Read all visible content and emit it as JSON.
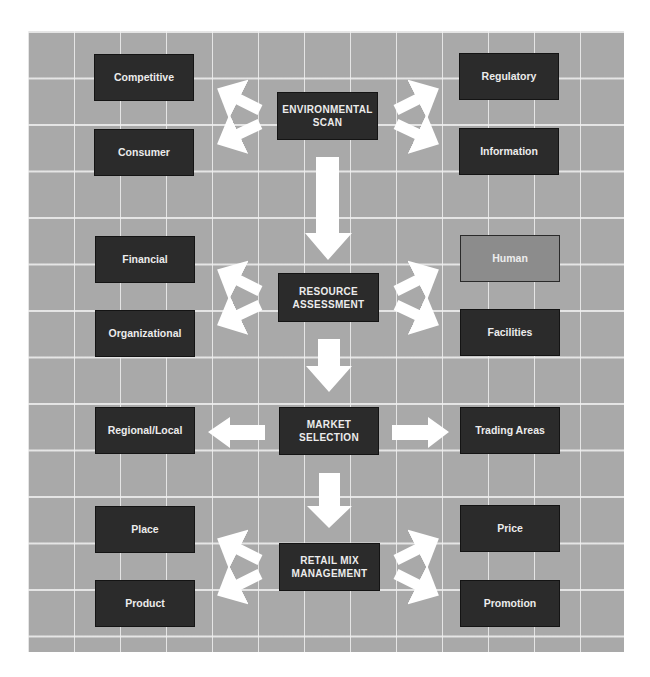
{
  "diagram": {
    "background_color": "#a9a9a9",
    "box_color": "#2b2b2b",
    "highlight_box_color": "#8c8c8c",
    "arrow_color": "#ffffff",
    "stages": [
      {
        "label": "ENVIRONMENTAL\nSCAN",
        "left": [
          "Competitive",
          "Consumer"
        ],
        "right": [
          "Regulatory",
          "Information"
        ]
      },
      {
        "label": "RESOURCE\nASSESSMENT",
        "left": [
          "Financial",
          "Organizational"
        ],
        "right": [
          "Human",
          "Facilities"
        ]
      },
      {
        "label": "MARKET\nSELECTION",
        "left": [
          "Regional/Local"
        ],
        "right": [
          "Trading Areas"
        ]
      },
      {
        "label": "RETAIL MIX\nMANAGEMENT",
        "left": [
          "Place",
          "Product"
        ],
        "right": [
          "Price",
          "Promotion"
        ]
      }
    ]
  }
}
